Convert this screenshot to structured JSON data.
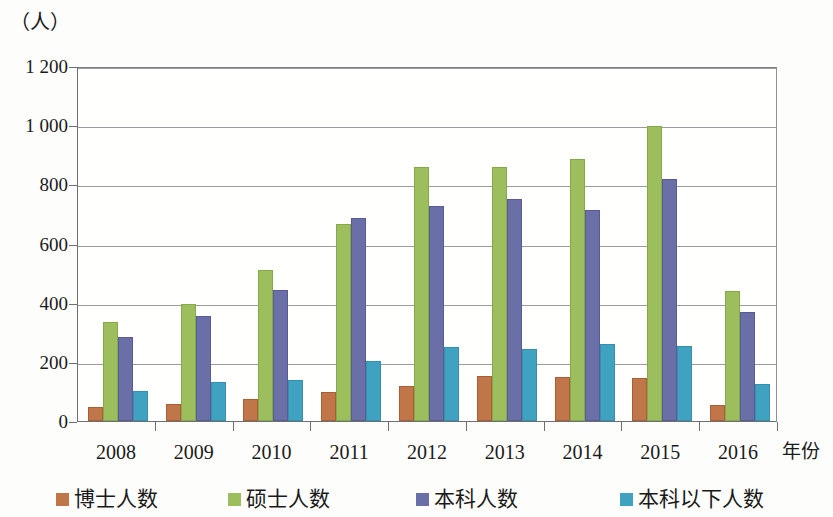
{
  "chart_data": {
    "type": "bar",
    "title": "",
    "subtitle": "",
    "unit_caption": "（人）",
    "xlabel": "年份",
    "ylabel": "",
    "categories": [
      "2008",
      "2009",
      "2010",
      "2011",
      "2012",
      "2013",
      "2014",
      "2015",
      "2016"
    ],
    "series": [
      {
        "name": "博士人数",
        "color": "#c1764a",
        "values": [
          40,
          52,
          69,
          90,
          113,
          146,
          141,
          137,
          47
        ]
      },
      {
        "name": "硕士人数",
        "color": "#9cbe5c",
        "values": [
          328,
          390,
          503,
          660,
          851,
          851,
          880,
          990,
          432
        ]
      },
      {
        "name": "本科人数",
        "color": "#6b6fa8",
        "values": [
          277,
          348,
          437,
          678,
          720,
          744,
          705,
          810,
          362
        ]
      },
      {
        "name": "本科以下人数",
        "color": "#3fa2c0",
        "values": [
          95,
          125,
          132,
          197,
          242,
          236,
          253,
          247,
          119
        ]
      }
    ],
    "ylim": [
      0,
      1200
    ],
    "ytick_values": [
      0,
      200,
      400,
      600,
      800,
      1000,
      1200
    ],
    "ytick_labels": [
      "0",
      "200",
      "400",
      "600",
      "800",
      "1 000",
      "1 200"
    ],
    "grid": true,
    "legend_position": "bottom"
  }
}
